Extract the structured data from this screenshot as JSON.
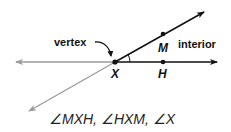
{
  "diagram": {
    "labels": {
      "vertex": "vertex",
      "interior": "interior",
      "point_x": "X",
      "point_m": "M",
      "point_h": "H"
    },
    "caption": "∠MXH, ∠HXM, ∠X",
    "colors": {
      "ray": "#111111",
      "extension": "#9a9a9a",
      "text": "#111111"
    }
  }
}
